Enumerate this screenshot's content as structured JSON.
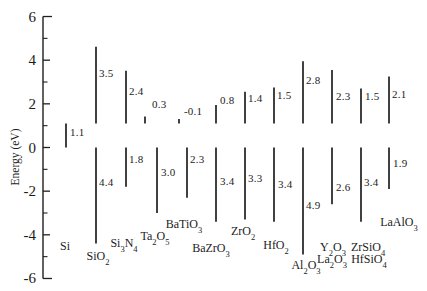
{
  "figure": {
    "background": "#ffffff",
    "ink_color": "#1f1f1f"
  },
  "axis": {
    "title": "Energy (eV)",
    "x": 43,
    "top_e": 6,
    "bottom_e": -6,
    "zero_y": 147.5,
    "px_per_ev": 21.83,
    "line_width": 1.4,
    "major_ticks": [
      {
        "e": 6,
        "label": "6"
      },
      {
        "e": 4,
        "label": "4"
      },
      {
        "e": 2,
        "label": "2"
      },
      {
        "e": 0,
        "label": "0"
      },
      {
        "e": -2,
        "label": "-2"
      },
      {
        "e": -4,
        "label": "-4"
      },
      {
        "e": -6,
        "label": "-6"
      }
    ],
    "minor_ticks": [
      5,
      3,
      1,
      -1,
      -3,
      -5
    ]
  },
  "chart_data": {
    "type": "band-offset-diagram",
    "ylabel": "Energy (eV)",
    "ylim": [
      -6,
      6
    ],
    "reference": {
      "si_conduction_band_e": 1.1,
      "si_valence_band_e": 0,
      "si_band_gap": 1.1
    },
    "materials": [
      {
        "formula": "Si",
        "band_gap": 1.1,
        "label_value": "1.1"
      },
      {
        "formula": "SiO2",
        "cb_offset": 3.5,
        "vb_offset": 4.4
      },
      {
        "formula": "Si3N4",
        "cb_offset": 2.4,
        "vb_offset": 1.8
      },
      {
        "formula": "Ta2O5",
        "cb_offset": 0.3,
        "vb_offset": 3.0
      },
      {
        "formula": "BaTiO3",
        "cb_offset": -0.1,
        "vb_offset": 2.3
      },
      {
        "formula": "BaZrO3",
        "cb_offset": 0.8,
        "vb_offset": 3.4
      },
      {
        "formula": "ZrO2",
        "cb_offset": 1.4,
        "vb_offset": 3.3
      },
      {
        "formula": "HfO2",
        "cb_offset": 1.5,
        "vb_offset": 3.4
      },
      {
        "formula": "Al2O3",
        "cb_offset": 2.8,
        "vb_offset": 4.9
      },
      {
        "formula": "Y2O3 / La2O3",
        "cb_offset": 2.3,
        "vb_offset": 2.6
      },
      {
        "formula": "ZrSiO4 / HfSiO4",
        "cb_offset": 1.5,
        "vb_offset": 3.4
      },
      {
        "formula": "LaAlO3",
        "cb_offset": 2.1,
        "vb_offset": 1.9
      }
    ]
  },
  "columns": [
    {
      "x": 66,
      "top": {
        "e1": 0,
        "e2": 1.1
      },
      "top_label": {
        "text": "1.1",
        "x": 70,
        "y": 132
      },
      "formulas": [
        {
          "text": "Si",
          "x": 65,
          "y": 246
        }
      ]
    },
    {
      "x": 96,
      "top": {
        "e1": 1.1,
        "e2": 4.62
      },
      "top_label": {
        "text": "3.5",
        "x": 99,
        "y": 73
      },
      "bottom": {
        "e1": 0,
        "e2": -4.4
      },
      "bottom_label": {
        "text": "4.4",
        "x": 99,
        "y": 182
      },
      "formulas": [
        {
          "text": "SiO2",
          "x": 98,
          "y": 256
        }
      ]
    },
    {
      "x": 126,
      "top": {
        "e1": 1.1,
        "e2": 3.52
      },
      "top_label": {
        "text": "2.4",
        "x": 129,
        "y": 91
      },
      "bottom": {
        "e1": 0,
        "e2": -1.8
      },
      "bottom_label": {
        "text": "1.8",
        "x": 129,
        "y": 159
      },
      "formulas": [
        {
          "text": "Si3N4",
          "x": 124,
          "y": 243
        }
      ]
    },
    {
      "x": 157,
      "top": {
        "x": 145,
        "e1": 1.1,
        "e2": 1.42
      },
      "top_label": {
        "text": "0.3",
        "x": 152,
        "y": 104
      },
      "bottom": {
        "e1": 0,
        "e2": -3.0
      },
      "bottom_label": {
        "text": "3.0",
        "x": 161,
        "y": 172
      },
      "formulas": [
        {
          "text": "Ta2O5",
          "x": 155,
          "y": 236
        }
      ]
    },
    {
      "x": 187,
      "top": {
        "x": 179,
        "e1": 1.1,
        "e2": 1.3
      },
      "top_label": {
        "text": "-0.1",
        "x": 184,
        "y": 111
      },
      "bottom": {
        "e1": 0,
        "e2": -2.3
      },
      "bottom_label": {
        "text": "2.3",
        "x": 190,
        "y": 159
      },
      "formulas": [
        {
          "text": "BaTiO3",
          "x": 184,
          "y": 224
        }
      ]
    },
    {
      "x": 216,
      "top": {
        "e1": 1.1,
        "e2": 1.95
      },
      "top_label": {
        "text": "0.8",
        "x": 220,
        "y": 100
      },
      "bottom": {
        "e1": 0,
        "e2": -3.4
      },
      "bottom_label": {
        "text": "3.4",
        "x": 220,
        "y": 181
      },
      "formulas": [
        {
          "text": "BaZrO3",
          "x": 211,
          "y": 248
        }
      ]
    },
    {
      "x": 245,
      "top": {
        "e1": 1.1,
        "e2": 2.55
      },
      "top_label": {
        "text": "1.4",
        "x": 248,
        "y": 98
      },
      "bottom": {
        "e1": 0,
        "e2": -3.3
      },
      "bottom_label": {
        "text": "3.3",
        "x": 248,
        "y": 178
      },
      "formulas": [
        {
          "text": "ZrO2",
          "x": 243,
          "y": 231
        }
      ]
    },
    {
      "x": 274,
      "top": {
        "e1": 1.1,
        "e2": 2.75
      },
      "top_label": {
        "text": "1.5",
        "x": 277,
        "y": 95
      },
      "bottom": {
        "e1": 0,
        "e2": -3.4
      },
      "bottom_label": {
        "text": "3.4",
        "x": 278,
        "y": 184
      },
      "formulas": [
        {
          "text": "HfO2",
          "x": 276,
          "y": 245
        }
      ]
    },
    {
      "x": 303,
      "top": {
        "e1": 1.1,
        "e2": 3.95
      },
      "top_label": {
        "text": "2.8",
        "x": 306,
        "y": 80
      },
      "bottom": {
        "e1": 0,
        "e2": -4.9
      },
      "bottom_label": {
        "text": "4.9",
        "x": 306,
        "y": 205
      },
      "formulas": [
        {
          "text": "Al2O3",
          "x": 306,
          "y": 265
        }
      ]
    },
    {
      "x": 332,
      "top": {
        "e1": 1.1,
        "e2": 3.55
      },
      "top_label": {
        "text": "2.3",
        "x": 336,
        "y": 96
      },
      "bottom": {
        "e1": 0,
        "e2": -2.6
      },
      "bottom_label": {
        "text": "2.6",
        "x": 336,
        "y": 187
      },
      "formulas": [
        {
          "text": "Y2O3",
          "x": 333,
          "y": 247
        },
        {
          "text": "La2O3",
          "x": 332,
          "y": 259
        }
      ]
    },
    {
      "x": 361,
      "top": {
        "e1": 1.1,
        "e2": 2.7
      },
      "top_label": {
        "text": "1.5",
        "x": 365,
        "y": 96
      },
      "bottom": {
        "e1": 0,
        "e2": -3.4
      },
      "bottom_label": {
        "text": "3.4",
        "x": 364,
        "y": 182
      },
      "formulas": [
        {
          "text": "ZrSiO4",
          "x": 368,
          "y": 247
        },
        {
          "text": "HfSiO4",
          "x": 369,
          "y": 259
        }
      ]
    },
    {
      "x": 389,
      "top": {
        "e1": 1.1,
        "e2": 3.25
      },
      "top_label": {
        "text": "2.1",
        "x": 392,
        "y": 94
      },
      "bottom": {
        "e1": 0,
        "e2": -1.9
      },
      "bottom_label": {
        "text": "1.9",
        "x": 393,
        "y": 163
      },
      "formulas": [
        {
          "text": "LaAlO3",
          "x": 399,
          "y": 222
        }
      ]
    }
  ]
}
